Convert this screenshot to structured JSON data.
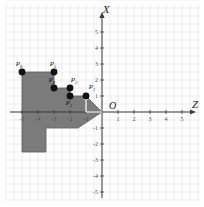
{
  "figure": {
    "title": "",
    "axes": {
      "vertical": {
        "name": "X",
        "label": "X",
        "ticks": [
          "5",
          "4",
          "3",
          "2",
          "1",
          "-1",
          "-2",
          "-3",
          "-4",
          "-5"
        ]
      },
      "horizontal": {
        "name": "Z",
        "label": "Z",
        "ticks": [
          "-5",
          "-4",
          "-3",
          "-2",
          "-1",
          "1",
          "2",
          "3",
          "4",
          "5"
        ]
      },
      "origin_label": "O"
    },
    "grid": {
      "visible": true,
      "color": "#d8d8e0",
      "spacing_units": 0.5
    },
    "region": {
      "fill_color": "#7b7b7b",
      "stroke_color": "#5f5f5f",
      "vertices": [
        [
          0,
          0
        ],
        [
          -1,
          1
        ],
        [
          -2,
          1
        ],
        [
          -2,
          1.5
        ],
        [
          -3,
          1.5
        ],
        [
          -3,
          2.5
        ],
        [
          -5,
          2.5
        ],
        [
          -5,
          -2.5
        ],
        [
          -3.5,
          -2.5
        ],
        [
          -3.5,
          -1
        ],
        [
          -1.5,
          -1
        ]
      ]
    },
    "vector": {
      "color": "#ffffff",
      "from": [
        0,
        0
      ],
      "to": [
        -1,
        1
      ]
    },
    "points": [
      {
        "id": "P1",
        "label": "P",
        "sub": "1",
        "z": -1,
        "x": 1,
        "lx": 6,
        "ly": -7
      },
      {
        "id": "P2",
        "label": "P",
        "sub": "2",
        "z": -2,
        "x": 1,
        "lx": -1,
        "ly": 9
      },
      {
        "id": "P3",
        "label": "P",
        "sub": "3",
        "z": -2,
        "x": 1.5,
        "lx": 4,
        "ly": -6
      },
      {
        "id": "P4",
        "label": "P",
        "sub": "4",
        "z": -3,
        "x": 1.5,
        "lx": -2,
        "ly": -6
      },
      {
        "id": "P5",
        "label": "P",
        "sub": "5",
        "z": -3,
        "x": 2.5,
        "lx": -1,
        "ly": -6
      },
      {
        "id": "P6",
        "label": "P",
        "sub": "6",
        "z": -5,
        "x": 2.5,
        "lx": -3,
        "ly": -6
      }
    ]
  },
  "chart_data": {
    "type": "scatter",
    "title": "",
    "xlabel": "Z",
    "ylabel": "X",
    "xlim": [
      -5.6,
      5.6
    ],
    "ylim": [
      -5.6,
      5.6
    ],
    "grid": true,
    "legend": null,
    "categories": [
      "P1",
      "P2",
      "P3",
      "P4",
      "P5",
      "P6"
    ],
    "series": [
      {
        "name": "Vertices",
        "x": [
          -1,
          -2,
          -2,
          -3,
          -3,
          -5
        ],
        "y": [
          1,
          1,
          1.5,
          1.5,
          2.5,
          2.5
        ]
      }
    ],
    "annotations": [
      {
        "text": "O",
        "x": 0.35,
        "y": 0.35
      },
      {
        "text": "X",
        "x": 0,
        "y": 5.9
      },
      {
        "text": "Z",
        "x": 5.9,
        "y": 0
      }
    ],
    "shaded_region": {
      "label": "feasible-region",
      "x": [
        0,
        -1,
        -2,
        -2,
        -3,
        -3,
        -5,
        -5,
        -3.5,
        -3.5,
        -1.5
      ],
      "y": [
        0,
        1,
        1,
        1.5,
        1.5,
        2.5,
        2.5,
        -2.5,
        -2.5,
        -1,
        -1
      ]
    }
  }
}
